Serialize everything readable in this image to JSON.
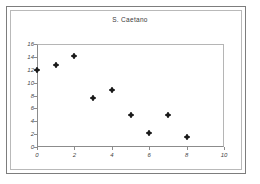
{
  "chart_data": {
    "type": "scatter",
    "title": "S. Caetano",
    "subtitle": "",
    "xlabel": "",
    "ylabel": "",
    "x": [
      0,
      1,
      2,
      3,
      4,
      5,
      6,
      7,
      8
    ],
    "values": [
      12.0,
      12.8,
      14.2,
      7.6,
      8.9,
      5.0,
      2.2,
      5.0,
      1.6
    ],
    "series": [
      {
        "name": "S. Caetano",
        "x": [
          0,
          1,
          2,
          3,
          4,
          5,
          6,
          7,
          8
        ],
        "values": [
          12.0,
          12.8,
          14.2,
          7.6,
          8.9,
          5.0,
          2.2,
          5.0,
          1.6
        ]
      }
    ],
    "xlim": [
      0,
      10
    ],
    "ylim": [
      0,
      16
    ],
    "xticks": [
      "0",
      "2",
      "4",
      "6",
      "8",
      "10"
    ],
    "xtick_values": [
      0,
      2,
      4,
      6,
      8,
      10
    ],
    "yticks": [
      "0",
      "2",
      "4",
      "6",
      "8",
      "10",
      "12",
      "14",
      "16"
    ],
    "ytick_values": [
      0,
      2,
      4,
      6,
      8,
      10,
      12,
      14,
      16
    ],
    "grid": false,
    "legend": false,
    "legend_position": "none",
    "marker": "diamond-plus",
    "marker_color": "#1a1a1a",
    "plot_border_color": "#8c8c8c",
    "background_color": "#ffffff",
    "annotations": []
  },
  "frame": {
    "border_color": "#7d7d7d",
    "inner_border_color": "#b9b9b9"
  }
}
